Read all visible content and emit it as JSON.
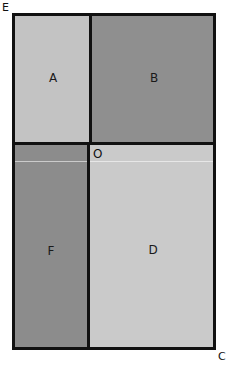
{
  "diagram": {
    "corner_labels": {
      "top_left": "E",
      "bottom_right": "C",
      "center": "O"
    },
    "regions": [
      {
        "id": "A",
        "label": "A",
        "position": "top-left",
        "fill": "#c3c3c3"
      },
      {
        "id": "B",
        "label": "B",
        "position": "top-right",
        "fill": "#8f8f8f"
      },
      {
        "id": "F",
        "label": "F",
        "position": "bottom-left",
        "fill": "#8c8c8c"
      },
      {
        "id": "D",
        "label": "D",
        "position": "bottom-right",
        "fill": "#cacaca"
      }
    ],
    "colors": {
      "border": "#111111",
      "background": "#ffffff"
    }
  }
}
